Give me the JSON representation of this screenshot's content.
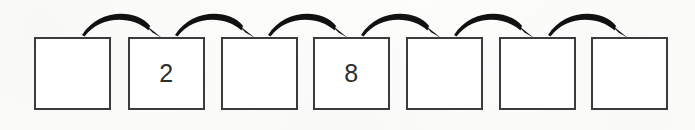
{
  "worksheet": {
    "type": "number-sequence-skip-counting",
    "background_color": "#fdfdfc",
    "box_border_color": "#3b3b3b",
    "box_fill_color": "#ffffff",
    "arrow_color": "#111111",
    "digit_color": "#2e2e2e",
    "box_count": 7,
    "arrow_count": 6,
    "cells": [
      {
        "index": 1,
        "value": "",
        "filled": false,
        "x": 34,
        "y": 37,
        "w": 77,
        "h": 73
      },
      {
        "index": 2,
        "value": "2",
        "filled": true,
        "x": 128,
        "y": 37,
        "w": 77,
        "h": 73
      },
      {
        "index": 3,
        "value": "",
        "filled": false,
        "x": 221,
        "y": 37,
        "w": 77,
        "h": 73
      },
      {
        "index": 4,
        "value": "8",
        "filled": true,
        "x": 313,
        "y": 37,
        "w": 77,
        "h": 73
      },
      {
        "index": 5,
        "value": "",
        "filled": false,
        "x": 406,
        "y": 37,
        "w": 77,
        "h": 73
      },
      {
        "index": 6,
        "value": "",
        "filled": false,
        "x": 499,
        "y": 37,
        "w": 77,
        "h": 73
      },
      {
        "index": 7,
        "value": "",
        "filled": false,
        "x": 591,
        "y": 37,
        "w": 77,
        "h": 73
      }
    ],
    "arrows": [
      {
        "index": 1,
        "from_cell": 1,
        "to_cell": 2,
        "x1": 82,
        "x2": 159,
        "apex_y": 11,
        "base_y": 36
      },
      {
        "index": 2,
        "from_cell": 2,
        "to_cell": 3,
        "x1": 175,
        "x2": 252,
        "apex_y": 11,
        "base_y": 36
      },
      {
        "index": 3,
        "from_cell": 3,
        "to_cell": 4,
        "x1": 268,
        "x2": 345,
        "apex_y": 11,
        "base_y": 36
      },
      {
        "index": 4,
        "from_cell": 4,
        "to_cell": 5,
        "x1": 361,
        "x2": 438,
        "apex_y": 11,
        "base_y": 36
      },
      {
        "index": 5,
        "from_cell": 5,
        "to_cell": 6,
        "x1": 454,
        "x2": 531,
        "apex_y": 11,
        "base_y": 36
      },
      {
        "index": 6,
        "from_cell": 6,
        "to_cell": 7,
        "x1": 548,
        "x2": 625,
        "apex_y": 11,
        "base_y": 36
      }
    ]
  }
}
